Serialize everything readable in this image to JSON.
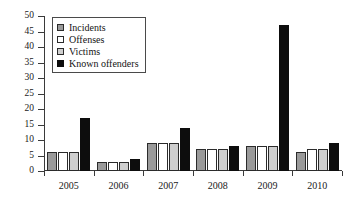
{
  "chart_data": {
    "type": "bar",
    "title": "",
    "xlabel": "",
    "ylabel": "",
    "categories": [
      "2005",
      "2006",
      "2007",
      "2008",
      "2009",
      "2010"
    ],
    "series": [
      {
        "name": "Incidents",
        "color": "#9a9a9a",
        "values": [
          6,
          3,
          9,
          7,
          8,
          6
        ]
      },
      {
        "name": "Offenses",
        "color": "#ffffff",
        "values": [
          6,
          3,
          9,
          7,
          8,
          7
        ]
      },
      {
        "name": "Victims",
        "color": "#cfcfcf",
        "values": [
          6,
          3,
          9,
          7,
          8,
          7
        ]
      },
      {
        "name": "Known offenders",
        "color": "#0d0d0d",
        "values": [
          17,
          4,
          14,
          8,
          47,
          9
        ]
      }
    ],
    "ylim": [
      0,
      50
    ],
    "yticks": [
      0,
      5,
      10,
      15,
      20,
      25,
      30,
      35,
      40,
      45,
      50
    ],
    "ytick_labels": [
      "0",
      "5",
      "10",
      "15",
      "20",
      "25",
      "30",
      "35",
      "40",
      "45",
      "50"
    ],
    "grid": false,
    "legend_position": "upper-left",
    "legend_entries": [
      "Incidents",
      "Offenses",
      "Victims",
      "Known offenders"
    ]
  }
}
